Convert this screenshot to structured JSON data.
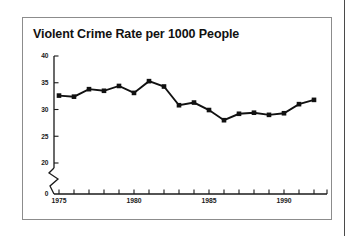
{
  "figure": {
    "title": "Violent Crime Rate per 1000 People"
  },
  "chart_data": {
    "type": "line",
    "title": "Violent Crime Rate per 1000 People",
    "xlabel": "",
    "ylabel": "",
    "xlim": [
      1974.5,
      1992.6
    ],
    "ylim": [
      20,
      40
    ],
    "grid": false,
    "legend": null,
    "axis_break": {
      "present": true,
      "between": [
        0,
        20
      ],
      "style": "zigzag"
    },
    "marker": "square",
    "line_color": "#111111",
    "marker_color": "#111111",
    "y_ticks": [
      0,
      20,
      25,
      30,
      35,
      40
    ],
    "y_tick_labels": [
      "0",
      "20",
      "25",
      "30",
      "35",
      "40"
    ],
    "x_ticks": [
      1975,
      1976,
      1977,
      1978,
      1979,
      1980,
      1981,
      1982,
      1983,
      1984,
      1985,
      1986,
      1987,
      1988,
      1989,
      1990,
      1991,
      1992
    ],
    "x_tick_labels_shown": [
      "1975",
      "1980",
      "1985",
      "1990"
    ],
    "x": [
      1975,
      1976,
      1977,
      1978,
      1979,
      1980,
      1981,
      1982,
      1983,
      1984,
      1985,
      1986,
      1987,
      1988,
      1989,
      1990,
      1991,
      1992
    ],
    "values": [
      32.6,
      32.4,
      33.8,
      33.5,
      34.4,
      33.1,
      35.3,
      34.3,
      30.8,
      31.3,
      29.9,
      28.0,
      29.2,
      29.4,
      29.0,
      29.3,
      31.0,
      31.8
    ]
  }
}
